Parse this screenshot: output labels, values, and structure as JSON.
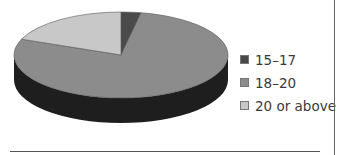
{
  "chart_data": {
    "type": "pie",
    "style": "3d",
    "title": "",
    "categories": [
      "15–17",
      "18–20",
      "20 or above"
    ],
    "values": [
      3,
      78,
      19
    ],
    "unit": "percent (estimated)",
    "colors": [
      "#4a4a4a",
      "#8c8c8c",
      "#c8c8c8"
    ],
    "side_color": "#1e1e1e",
    "legend_position": "right"
  },
  "legend": {
    "items": [
      {
        "label": "15–17",
        "color": "#4a4a4a"
      },
      {
        "label": "18–20",
        "color": "#8c8c8c"
      },
      {
        "label": "20 or above",
        "color": "#c8c8c8"
      }
    ]
  }
}
